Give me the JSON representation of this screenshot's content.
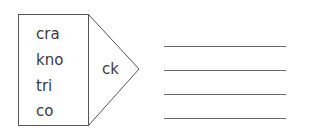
{
  "exercise": {
    "onsets": [
      "cra",
      "kno",
      "tri",
      "co"
    ],
    "rime": "ck",
    "answer_lines": [
      "",
      "",
      "",
      ""
    ]
  },
  "colors": {
    "stroke": "#555555",
    "text": "#3a3a3a",
    "line": "#6a6a6a"
  }
}
